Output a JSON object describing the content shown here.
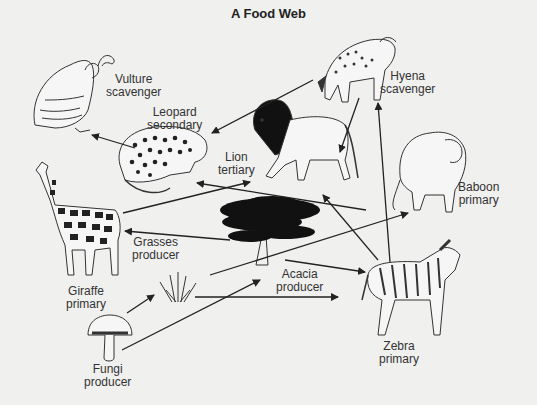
{
  "title": "A Food Web",
  "organisms": [
    {
      "id": "vulture",
      "name": "Vulture",
      "role": "scavenger"
    },
    {
      "id": "hyena",
      "name": "Hyena",
      "role": "scavenger"
    },
    {
      "id": "leopard",
      "name": "Leopard",
      "role": "secondary"
    },
    {
      "id": "lion",
      "name": "Lion",
      "role": "tertiary"
    },
    {
      "id": "baboon",
      "name": "Baboon",
      "role": "primary"
    },
    {
      "id": "giraffe",
      "name": "Giraffe",
      "role": "primary"
    },
    {
      "id": "grasses",
      "name": "Grasses",
      "role": "producer"
    },
    {
      "id": "acacia",
      "name": "Acacia",
      "role": "producer"
    },
    {
      "id": "zebra",
      "name": "Zebra",
      "role": "primary"
    },
    {
      "id": "fungi",
      "name": "Fungi",
      "role": "producer"
    }
  ],
  "arrows": [
    {
      "from": "leopard",
      "to": "vulture"
    },
    {
      "from": "hyena",
      "to": "leopard"
    },
    {
      "from": "hyena",
      "to": "lion"
    },
    {
      "from": "zebra",
      "to": "hyena"
    },
    {
      "from": "giraffe",
      "to": "lion"
    },
    {
      "from": "baboon",
      "to": "leopard"
    },
    {
      "from": "zebra",
      "to": "lion"
    },
    {
      "from": "acacia",
      "to": "giraffe"
    },
    {
      "from": "grasses",
      "to": "baboon"
    },
    {
      "from": "acacia",
      "to": "zebra"
    },
    {
      "from": "grasses",
      "to": "zebra"
    },
    {
      "from": "fungi",
      "to": "grasses"
    },
    {
      "from": "fungi",
      "to": "acacia"
    }
  ],
  "colors": {
    "background": "#f0f0ef",
    "ink": "#222222"
  }
}
